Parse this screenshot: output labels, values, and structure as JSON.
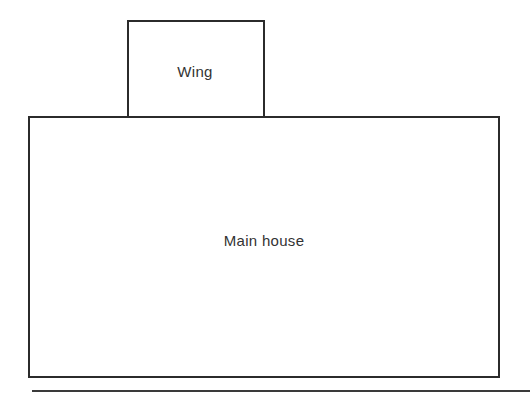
{
  "diagram": {
    "type": "floor-plan-blocks",
    "shapes": [
      {
        "id": "wing",
        "label": "Wing",
        "shape": "rectangle",
        "position": "top, attached to main house roofline, left-of-center"
      },
      {
        "id": "main-house",
        "label": "Main house",
        "shape": "rectangle",
        "position": "bottom, large"
      }
    ],
    "relationships": [
      {
        "from": "wing",
        "to": "main-house",
        "type": "adjoins"
      }
    ]
  },
  "labels": {
    "wing": "Wing",
    "main_house": "Main house"
  },
  "colors": {
    "stroke": "#2b2b2b",
    "text": "#333333",
    "background": "#ffffff"
  }
}
